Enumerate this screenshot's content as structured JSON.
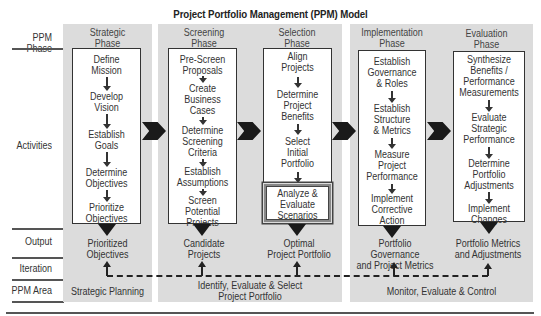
{
  "title": "Project Portfolio Management (PPM) Model",
  "row_labels": {
    "phase": "PPM Phase",
    "activities": "Activities",
    "output": "Output",
    "iteration": "Iteration",
    "area": "PPM Area"
  },
  "phases": [
    {
      "name": "Strategic\nPhase",
      "activities": [
        "Define\nMission",
        "Develop\nVision",
        "Establish\nGoals",
        "Determine\nObjectives",
        "Prioritize\nObjectives"
      ],
      "output": "Prioritized\nObjectives"
    },
    {
      "name": "Screening\nPhase",
      "activities": [
        "Pre-Screen\nProposals",
        "Create\nBusiness\nCases",
        "Determine\nScreening\nCriteria",
        "Establish\nAssumptions",
        "Screen\nPotential\nProjects"
      ],
      "output": "Candidate\nProjects"
    },
    {
      "name": "Selection\nPhase",
      "activities": [
        "Align\nProjects",
        "Determine\nProject\nBenefits",
        "Select\nInitial\nPortfolio"
      ],
      "highlight_activity": "Analyze &\nEvaluate\nScenarios",
      "output": "Optimal\nProject Portfolio"
    },
    {
      "name": "Implementation\nPhase",
      "activities": [
        "Establish\nGovernance\n& Roles",
        "Establish\nStructure\n& Metrics",
        "Measure\nProject\nPerformance",
        "Implement\nCorrective\nAction"
      ],
      "output": "Portfolio Governance\nand Project Metrics"
    },
    {
      "name": "Evaluation\nPhase",
      "activities": [
        "Synthesize\nBenefits /\nPerformance\nMeasurements",
        "Evaluate\nStrategic\nPerformance",
        "Determine\nPortfolio\nAdjustments",
        "Implement\nChanges"
      ],
      "output": "Portfolio Metrics\nand Adjustments"
    }
  ],
  "areas": [
    "Strategic Planning",
    "Identify, Evaluate & Select\nProject Portfolio",
    "Monitor, Evaluate & Control"
  ],
  "colors": {
    "panel": "#dcdcdc",
    "box_border": "#333333",
    "arrow": "#1a1a1a"
  }
}
